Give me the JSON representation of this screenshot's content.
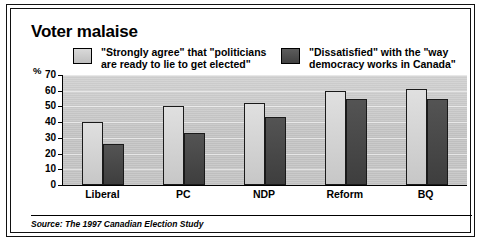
{
  "figure": {
    "title": "Voter malaise",
    "source_note": "Source: The 1997 Canadian Election Study",
    "axis_unit": "%"
  },
  "legend": {
    "entries": [
      {
        "label": "\"Strongly agree\" that \"politicians\nare ready to lie to get elected\"",
        "swatch": "light-gray-swatch",
        "color": "#cfcfcf"
      },
      {
        "label": "\"Dissatisfied\" with the \"way\ndemocracy works in Canada\"",
        "swatch": "dark-gray-swatch",
        "color": "#454545"
      }
    ]
  },
  "chart_data": {
    "type": "bar",
    "title": "Voter malaise",
    "subtitle": "",
    "xlabel": "",
    "ylabel": "%",
    "ylim": [
      0,
      70
    ],
    "yticks": [
      0,
      10,
      20,
      30,
      40,
      50,
      60,
      70
    ],
    "ytick_labels": [
      "0",
      "10",
      "20",
      "30",
      "40",
      "50",
      "60",
      "70"
    ],
    "grid": true,
    "legend_position": "top",
    "categories": [
      "Liberal",
      "PC",
      "NDP",
      "Reform",
      "BQ"
    ],
    "series": [
      {
        "name": "\"Strongly agree\" that \"politicians are ready to lie to get elected\"",
        "color": "#cfcfcf",
        "values": [
          40,
          50,
          52,
          60,
          61
        ]
      },
      {
        "name": "\"Dissatisfied\" with the \"way democracy works in Canada\"",
        "color": "#454545",
        "values": [
          26,
          33,
          43,
          55,
          55
        ]
      }
    ],
    "annotations": [
      "Source: The 1997 Canadian Election Study"
    ]
  }
}
